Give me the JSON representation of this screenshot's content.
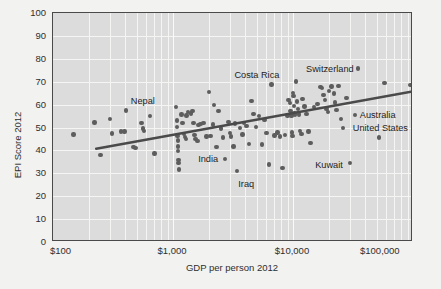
{
  "chart_data": {
    "type": "scatter",
    "title": "",
    "xlabel": "GDP per person 2012",
    "ylabel": "EPI Score 2012",
    "xscale": "log",
    "xlim": [
      100,
      100000
    ],
    "ylim": [
      0,
      100
    ],
    "grid": true,
    "legend": "none",
    "xticks": [
      "$100",
      "$1,000",
      "$10,000",
      "$100,000"
    ],
    "xtick_values": [
      100,
      1000,
      10000,
      100000
    ],
    "yticks": [
      "0",
      "10",
      "20",
      "30",
      "40",
      "50",
      "60",
      "70",
      "80",
      "90",
      "100"
    ],
    "ytick_values": [
      0,
      10,
      20,
      30,
      40,
      50,
      60,
      70,
      80,
      90,
      100
    ],
    "marker_color": "#5d5d5d",
    "trendline_color": "#4a4a4a",
    "plot_background": "#dcdcdc",
    "figure_background": "#f2f2f0",
    "trendline": {
      "x_start": 230,
      "y_start": 40.2,
      "x_end": 100000,
      "y_end": 65.3
    },
    "annotations": [
      {
        "label": "Nepal",
        "x": 560,
        "y": 61.5,
        "align": "center"
      },
      {
        "label": "Costa Rica",
        "x": 5000,
        "y": 73.0,
        "align": "center"
      },
      {
        "label": "Switzerland",
        "x": 32000,
        "y": 75.5,
        "align": "right"
      },
      {
        "label": "Australia",
        "x": 36000,
        "y": 55.5,
        "align": "left"
      },
      {
        "label": "United States",
        "x": 31500,
        "y": 50.0,
        "align": "left"
      },
      {
        "label": "Kuwait",
        "x": 26000,
        "y": 33.5,
        "align": "right"
      },
      {
        "label": "India",
        "x": 1620,
        "y": 36.3,
        "align": "left"
      },
      {
        "label": "Iraq",
        "x": 3500,
        "y": 25.3,
        "align": "left"
      }
    ],
    "points": [
      {
        "x": 148,
        "y": 47.0
      },
      {
        "x": 222,
        "y": 52.2
      },
      {
        "x": 248,
        "y": 38.1
      },
      {
        "x": 300,
        "y": 53.8
      },
      {
        "x": 310,
        "y": 47.3
      },
      {
        "x": 370,
        "y": 48.3
      },
      {
        "x": 395,
        "y": 48.2
      },
      {
        "x": 405,
        "y": 57.5
      },
      {
        "x": 470,
        "y": 41.6
      },
      {
        "x": 486,
        "y": 41.0
      },
      {
        "x": 545,
        "y": 52.1
      },
      {
        "x": 560,
        "y": 49.6
      },
      {
        "x": 570,
        "y": 48.6
      },
      {
        "x": 640,
        "y": 54.9
      },
      {
        "x": 700,
        "y": 38.6
      },
      {
        "x": 1060,
        "y": 58.9
      },
      {
        "x": 1075,
        "y": 53.0
      },
      {
        "x": 1085,
        "y": 50.1
      },
      {
        "x": 1090,
        "y": 46.3
      },
      {
        "x": 1095,
        "y": 44.4
      },
      {
        "x": 1100,
        "y": 41.7
      },
      {
        "x": 1105,
        "y": 39.7
      },
      {
        "x": 1110,
        "y": 35.9
      },
      {
        "x": 1115,
        "y": 34.6
      },
      {
        "x": 1120,
        "y": 31.7
      },
      {
        "x": 1180,
        "y": 55.6
      },
      {
        "x": 1200,
        "y": 51.9
      },
      {
        "x": 1230,
        "y": 47.1
      },
      {
        "x": 1260,
        "y": 45.9
      },
      {
        "x": 1290,
        "y": 45.0
      },
      {
        "x": 1300,
        "y": 55.2
      },
      {
        "x": 1330,
        "y": 56.8
      },
      {
        "x": 1420,
        "y": 56.2
      },
      {
        "x": 1450,
        "y": 57.2
      },
      {
        "x": 1480,
        "y": 52.0
      },
      {
        "x": 1510,
        "y": 46.6
      },
      {
        "x": 1540,
        "y": 45.0
      },
      {
        "x": 1600,
        "y": 44.2
      },
      {
        "x": 1630,
        "y": 51.2
      },
      {
        "x": 1700,
        "y": 51.5
      },
      {
        "x": 1800,
        "y": 52.0
      },
      {
        "x": 1900,
        "y": 46.0
      },
      {
        "x": 2000,
        "y": 65.5
      },
      {
        "x": 2050,
        "y": 46.2
      },
      {
        "x": 2150,
        "y": 51.3
      },
      {
        "x": 2200,
        "y": 59.9
      },
      {
        "x": 2300,
        "y": 41.6
      },
      {
        "x": 2400,
        "y": 57.2
      },
      {
        "x": 2500,
        "y": 49.5
      },
      {
        "x": 2600,
        "y": 45.7
      },
      {
        "x": 2700,
        "y": 36.2
      },
      {
        "x": 2900,
        "y": 52.4
      },
      {
        "x": 3000,
        "y": 47.5
      },
      {
        "x": 3050,
        "y": 46.0
      },
      {
        "x": 3200,
        "y": 41.7
      },
      {
        "x": 3300,
        "y": 51.8
      },
      {
        "x": 3400,
        "y": 31.0
      },
      {
        "x": 3600,
        "y": 49.8
      },
      {
        "x": 3800,
        "y": 47.0
      },
      {
        "x": 3900,
        "y": 52.0
      },
      {
        "x": 4100,
        "y": 50.6
      },
      {
        "x": 4300,
        "y": 42.7
      },
      {
        "x": 4500,
        "y": 61.6
      },
      {
        "x": 4700,
        "y": 55.9
      },
      {
        "x": 4900,
        "y": 50.3
      },
      {
        "x": 5200,
        "y": 55.0
      },
      {
        "x": 5500,
        "y": 42.6
      },
      {
        "x": 5800,
        "y": 53.2
      },
      {
        "x": 6000,
        "y": 47.6
      },
      {
        "x": 6300,
        "y": 33.9
      },
      {
        "x": 6600,
        "y": 68.7
      },
      {
        "x": 7000,
        "y": 46.5
      },
      {
        "x": 7400,
        "y": 47.8
      },
      {
        "x": 7800,
        "y": 46.0
      },
      {
        "x": 8200,
        "y": 32.3
      },
      {
        "x": 8600,
        "y": 46.8
      },
      {
        "x": 9000,
        "y": 55.2
      },
      {
        "x": 9200,
        "y": 62.0
      },
      {
        "x": 9400,
        "y": 60.6
      },
      {
        "x": 9500,
        "y": 57.3
      },
      {
        "x": 9600,
        "y": 55.6
      },
      {
        "x": 9700,
        "y": 54.9
      },
      {
        "x": 9800,
        "y": 47.8
      },
      {
        "x": 9900,
        "y": 46.3
      },
      {
        "x": 10000,
        "y": 65.0
      },
      {
        "x": 10100,
        "y": 63.8
      },
      {
        "x": 10200,
        "y": 59.5
      },
      {
        "x": 10300,
        "y": 56.2
      },
      {
        "x": 10400,
        "y": 55.4
      },
      {
        "x": 10600,
        "y": 70.1
      },
      {
        "x": 10800,
        "y": 61.3
      },
      {
        "x": 11000,
        "y": 58.2
      },
      {
        "x": 11200,
        "y": 55.7
      },
      {
        "x": 11500,
        "y": 48.6
      },
      {
        "x": 11800,
        "y": 47.2
      },
      {
        "x": 12000,
        "y": 62.5
      },
      {
        "x": 12500,
        "y": 59.2
      },
      {
        "x": 13000,
        "y": 55.9
      },
      {
        "x": 13500,
        "y": 48.2
      },
      {
        "x": 14000,
        "y": 43.3
      },
      {
        "x": 15000,
        "y": 58.9
      },
      {
        "x": 16000,
        "y": 60.2
      },
      {
        "x": 17000,
        "y": 67.8
      },
      {
        "x": 17500,
        "y": 67.2
      },
      {
        "x": 18000,
        "y": 64.3
      },
      {
        "x": 18500,
        "y": 62.1
      },
      {
        "x": 19000,
        "y": 58.0
      },
      {
        "x": 19500,
        "y": 56.9
      },
      {
        "x": 20000,
        "y": 66.0
      },
      {
        "x": 21000,
        "y": 67.9
      },
      {
        "x": 22000,
        "y": 64.8
      },
      {
        "x": 22500,
        "y": 61.0
      },
      {
        "x": 23000,
        "y": 57.6
      },
      {
        "x": 24000,
        "y": 68.1
      },
      {
        "x": 25000,
        "y": 53.8
      },
      {
        "x": 26000,
        "y": 49.9
      },
      {
        "x": 28000,
        "y": 62.8
      },
      {
        "x": 30000,
        "y": 34.6
      },
      {
        "x": 33000,
        "y": 55.4
      },
      {
        "x": 35000,
        "y": 75.8
      },
      {
        "x": 52000,
        "y": 45.7
      },
      {
        "x": 58000,
        "y": 69.4
      },
      {
        "x": 95000,
        "y": 68.5
      }
    ]
  }
}
